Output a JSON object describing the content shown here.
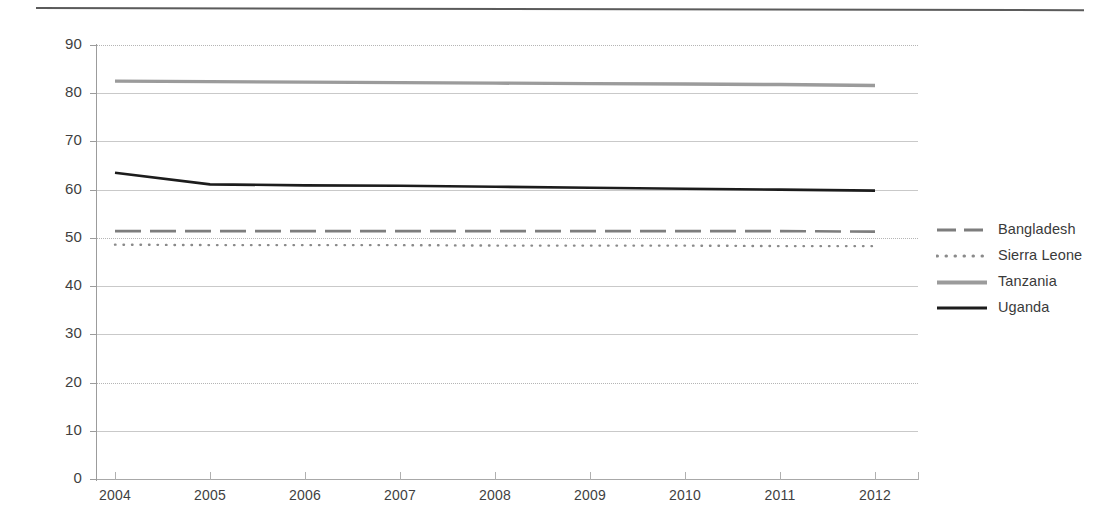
{
  "chart_data": {
    "type": "line",
    "title": "",
    "subtitle": "",
    "xlabel": "",
    "ylabel": "",
    "x": [
      "2004",
      "2005",
      "2006",
      "2007",
      "2008",
      "2009",
      "2010",
      "2011",
      "2012"
    ],
    "categories": [
      "2004",
      "2005",
      "2006",
      "2007",
      "2008",
      "2009",
      "2010",
      "2011",
      "2012"
    ],
    "ylim": [
      0,
      90
    ],
    "yticks": [
      0,
      10,
      20,
      30,
      40,
      50,
      60,
      70,
      80,
      90
    ],
    "ytick_labels": [
      "0",
      "10",
      "20",
      "30",
      "40",
      "50",
      "60",
      "70",
      "80",
      "90"
    ],
    "grid": true,
    "legend_position": "right",
    "series": [
      {
        "name": "Bangladesh",
        "style": "dashed",
        "color": "#7d7d7d",
        "width": 2.6,
        "values": [
          51.4,
          51.4,
          51.4,
          51.4,
          51.4,
          51.4,
          51.4,
          51.4,
          51.3
        ]
      },
      {
        "name": "Sierra Leone",
        "style": "dotted",
        "color": "#8a8a8a",
        "width": 2.4,
        "values": [
          48.6,
          48.5,
          48.5,
          48.5,
          48.4,
          48.4,
          48.4,
          48.3,
          48.3
        ]
      },
      {
        "name": "Tanzania",
        "style": "solid",
        "color": "#9b9b9b",
        "width": 3.4,
        "values": [
          82.5,
          82.4,
          82.3,
          82.2,
          82.1,
          82.0,
          81.9,
          81.8,
          81.6
        ]
      },
      {
        "name": "Uganda",
        "style": "solid",
        "color": "#1c1c1c",
        "width": 2.6,
        "values": [
          63.5,
          61.1,
          60.9,
          60.8,
          60.6,
          60.4,
          60.2,
          60.0,
          59.8
        ]
      }
    ]
  },
  "legend": {
    "items": [
      {
        "label": "Bangladesh",
        "swatch": "dashed-line-icon"
      },
      {
        "label": "Sierra Leone",
        "swatch": "dotted-line-icon"
      },
      {
        "label": "Tanzania",
        "swatch": "solid-gray-line-icon"
      },
      {
        "label": "Uganda",
        "swatch": "solid-black-line-icon"
      }
    ]
  },
  "colors": {
    "bangladesh": "#7d7d7d",
    "sierra_leone": "#8a8a8a",
    "tanzania": "#9b9b9b",
    "uganda": "#1c1c1c",
    "grid": "#c9c9c9",
    "axis": "#9c9c9c",
    "rule": "#5b5b5b",
    "text": "#3a3a3a"
  }
}
